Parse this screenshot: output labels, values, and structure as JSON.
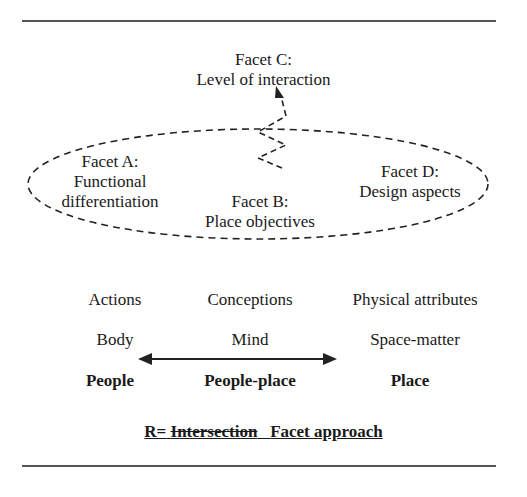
{
  "facets": {
    "c": {
      "title": "Facet C:",
      "subtitle": "Level of interaction"
    },
    "a": {
      "title": "Facet A:",
      "line1": "Functional",
      "line2": "differentiation"
    },
    "d": {
      "title": "Facet D:",
      "subtitle": "Design aspects"
    },
    "b": {
      "title": "Facet B:",
      "subtitle": "Place objectives"
    }
  },
  "columns": {
    "row1": [
      "Actions",
      "Conceptions",
      "Physical attributes"
    ],
    "row2": [
      "Body",
      "Mind",
      "Space-matter"
    ],
    "row3": [
      "People",
      "People-place",
      "Place"
    ]
  },
  "footer": {
    "prefix": "R=",
    "struck": "Intersection",
    "suffix": "Facet approach"
  },
  "colors": {
    "ink": "#1a1a1a",
    "rule": "#555555"
  }
}
